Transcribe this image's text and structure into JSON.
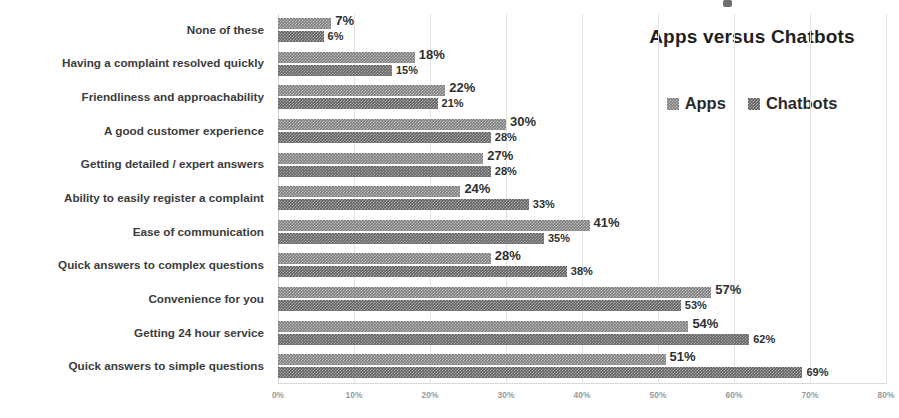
{
  "chart_data": {
    "type": "bar",
    "orientation": "horizontal",
    "title": "Apps versus Chatbots",
    "xlabel": "",
    "ylabel": "",
    "xlim": [
      0,
      80
    ],
    "xticks": [
      "0%",
      "10%",
      "20%",
      "30%",
      "40%",
      "50%",
      "60%",
      "70%",
      "80%"
    ],
    "xtick_values": [
      0,
      10,
      20,
      30,
      40,
      50,
      60,
      70,
      80
    ],
    "grid": true,
    "grid_axis": "x",
    "legend_position": "top-right",
    "categories": [
      "None of these",
      "Having a complaint resolved quickly",
      "Friendliness and approachability",
      "A good customer experience",
      "Getting detailed / expert answers",
      "Ability to easily register a complaint",
      "Ease of communication",
      "Quick answers to complex questions",
      "Convenience for you",
      "Getting 24 hour service",
      "Quick answers to simple questions"
    ],
    "series": [
      {
        "name": "Apps",
        "color": "#7d7d7d",
        "values": [
          7,
          18,
          22,
          30,
          27,
          24,
          41,
          28,
          57,
          54,
          51
        ],
        "labels": [
          "7%",
          "18%",
          "22%",
          "30%",
          "27%",
          "24%",
          "41%",
          "28%",
          "57%",
          "54%",
          "51%"
        ]
      },
      {
        "name": "Chatbots",
        "color": "#5f5f5f",
        "values": [
          6,
          15,
          21,
          28,
          28,
          33,
          35,
          38,
          53,
          62,
          69
        ],
        "labels": [
          "6%",
          "15%",
          "21%",
          "28%",
          "28%",
          "33%",
          "35%",
          "38%",
          "53%",
          "62%",
          "69%"
        ]
      }
    ]
  }
}
